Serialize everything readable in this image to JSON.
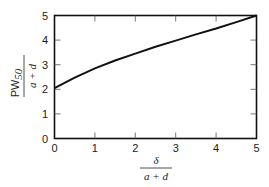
{
  "chart_data": {
    "type": "line",
    "title": "",
    "xlabel": {
      "numerator": "δ",
      "denominator": "a + d"
    },
    "ylabel": {
      "numerator": "PW",
      "numerator_sub": "50",
      "denominator": "a + d"
    },
    "xlim": [
      0,
      5
    ],
    "ylim": [
      0,
      5
    ],
    "xticks": [
      "0",
      "1",
      "2",
      "3",
      "4",
      "5"
    ],
    "yticks": [
      "0",
      "1",
      "2",
      "3",
      "4",
      "5"
    ],
    "grid": false,
    "legend": null,
    "series": [
      {
        "name": "PW50/(a+d)",
        "x": [
          0,
          0.5,
          1,
          1.5,
          2,
          2.5,
          3,
          3.5,
          4,
          4.5,
          5
        ],
        "values": [
          2.05,
          2.47,
          2.85,
          3.17,
          3.45,
          3.73,
          3.98,
          4.23,
          4.47,
          4.73,
          5.0
        ]
      }
    ]
  }
}
